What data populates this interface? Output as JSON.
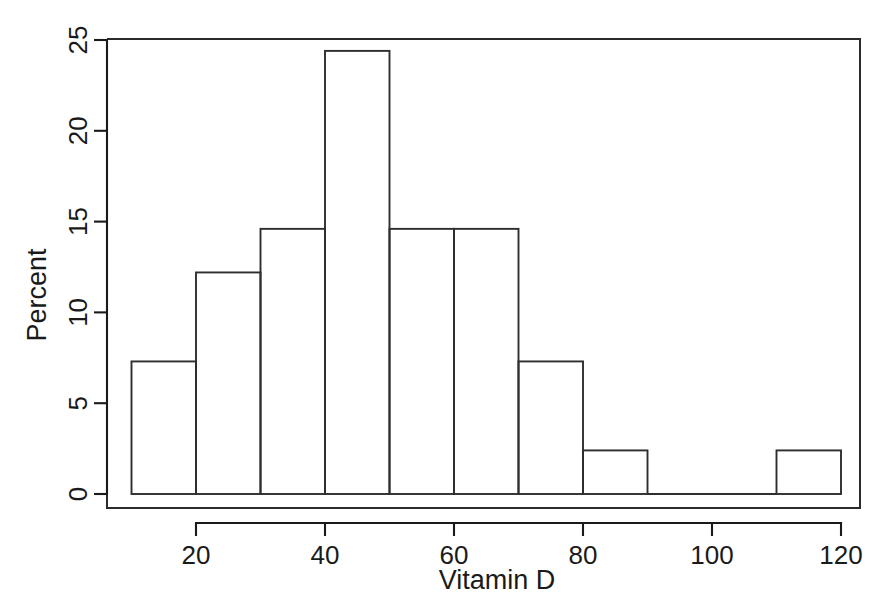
{
  "chart_data": {
    "type": "bar",
    "subtype": "histogram",
    "title": "",
    "xlabel": "Vitamin D",
    "ylabel": "Percent",
    "xlim": [
      8,
      128
    ],
    "ylim": [
      0,
      25.9
    ],
    "grid": false,
    "legend": null,
    "bin_width": 10,
    "bin_edges": [
      10,
      20,
      30,
      40,
      50,
      60,
      70,
      80,
      90,
      100,
      110,
      120
    ],
    "categories": [
      "10-20",
      "20-30",
      "30-40",
      "40-50",
      "50-60",
      "60-70",
      "70-80",
      "80-90",
      "90-100",
      "100-110",
      "110-120"
    ],
    "values": [
      7.3,
      12.2,
      14.6,
      24.4,
      14.6,
      14.6,
      7.3,
      2.4,
      0,
      0,
      2.4
    ],
    "bars": [
      {
        "x0": 10,
        "x1": 20,
        "value": 7.3
      },
      {
        "x0": 20,
        "x1": 30,
        "value": 12.2
      },
      {
        "x0": 30,
        "x1": 40,
        "value": 14.6
      },
      {
        "x0": 40,
        "x1": 50,
        "value": 24.4
      },
      {
        "x0": 50,
        "x1": 60,
        "value": 14.6
      },
      {
        "x0": 60,
        "x1": 70,
        "value": 14.6
      },
      {
        "x0": 70,
        "x1": 80,
        "value": 7.3
      },
      {
        "x0": 80,
        "x1": 90,
        "value": 2.4
      },
      {
        "x0": 90,
        "x1": 100,
        "value": 0
      },
      {
        "x0": 100,
        "x1": 110,
        "value": 0
      },
      {
        "x0": 110,
        "x1": 120,
        "value": 2.4
      }
    ],
    "xticks": [
      20,
      40,
      60,
      80,
      100,
      120
    ],
    "xtick_labels": [
      "20",
      "40",
      "60",
      "80",
      "100",
      "120"
    ],
    "yticks": [
      0,
      5,
      10,
      15,
      20,
      25
    ],
    "ytick_labels": [
      "0",
      "5",
      "10",
      "15",
      "20",
      "25"
    ],
    "colors": {
      "bar_stroke": "#2e2e2e",
      "bar_fill": "none",
      "axis": "#1a1a1a",
      "background": "#ffffff"
    }
  },
  "axes": {
    "x_title": "Vitamin D",
    "y_title": "Percent"
  }
}
